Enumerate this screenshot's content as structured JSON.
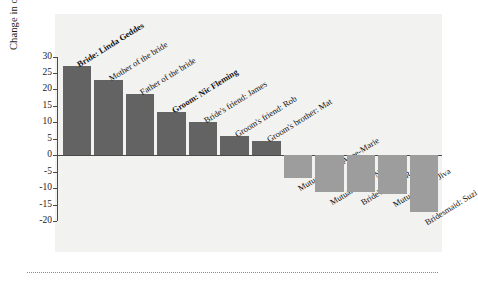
{
  "chart_data": {
    "type": "bar",
    "title": "",
    "xlabel": "",
    "ylabel": "Change in oxytocin levels (%)",
    "ylim": [
      -20,
      30
    ],
    "yticks": [
      30,
      25,
      20,
      15,
      10,
      5,
      0,
      -5,
      -10,
      -15,
      -20
    ],
    "ytick_labels": [
      "30",
      "25",
      "20",
      "15",
      "10",
      "5",
      "0",
      "-5",
      "-10",
      "-15",
      "-20"
    ],
    "grid": false,
    "legend": "none",
    "categories": [
      "Bride: Linda Geddes",
      "Mother of the bride",
      "Father of the bride",
      "Groom: Nic Fleming",
      "Bride's friend: James",
      "Groom's friend: Rob",
      "Groom's brother: Mat",
      "Mutual friend: Anne-Marie",
      "Mutual friend: Nicola",
      "Bride's friend: Rowan",
      "Mutual friend: Jiva",
      "Bridesmaid: Suzi"
    ],
    "values": [
      27.2,
      23.0,
      18.7,
      13.2,
      10.2,
      6.0,
      4.2,
      -7.0,
      -11.0,
      -11.2,
      -11.8,
      -17.2
    ],
    "emphasis": [
      true,
      false,
      false,
      true,
      false,
      false,
      false,
      false,
      false,
      false,
      false,
      false
    ],
    "colors": {
      "positive_bar": "#636363",
      "negative_bar": "#9d9d9d",
      "panel_background": "#f2f2f0",
      "axis": "#4a4a4a",
      "text": "#141414"
    }
  }
}
